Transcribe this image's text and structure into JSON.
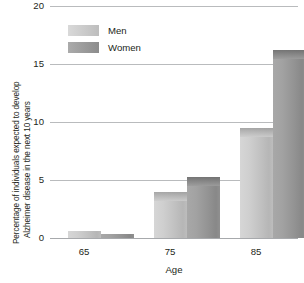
{
  "chart_data": {
    "type": "bar",
    "title": "",
    "categories": [
      "65",
      "75",
      "85"
    ],
    "series": [
      {
        "name": "Men",
        "values": [
          0.6,
          4.0,
          9.5
        ],
        "color": "#c8c8c8"
      },
      {
        "name": "Women",
        "values": [
          0.35,
          5.3,
          16.2
        ],
        "color": "#9a9a9a"
      }
    ],
    "xlabel": "Age",
    "ylabel": "Percentage of individuals expected to develop Alzheimer disease in the next 10 years",
    "ylabel_line1": "Percentage of individuals expected to develop",
    "ylabel_line2": "Alzheimer disease in the next 10 years",
    "ylim": [
      0,
      20
    ],
    "yticks": [
      0,
      5,
      10,
      15,
      20
    ],
    "ytick_labels": [
      "0",
      "5",
      "10",
      "15",
      "20"
    ],
    "grid": true,
    "legend_position": "top-left"
  },
  "axes": {
    "y_ticks": [
      {
        "label": "20"
      },
      {
        "label": "15"
      },
      {
        "label": "10"
      },
      {
        "label": "5"
      },
      {
        "label": "0"
      }
    ],
    "x_ticks": [
      {
        "label": "65"
      },
      {
        "label": "75"
      },
      {
        "label": "85"
      }
    ],
    "x_title": "Age",
    "y_title_line1": "Percentage of individuals expected to develop",
    "y_title_line2": "Alzheimer disease in the next 10 years"
  },
  "legend": {
    "items": [
      {
        "label": "Men",
        "color": "#c8c8c8"
      },
      {
        "label": "Women",
        "color": "#9a9a9a"
      }
    ]
  }
}
